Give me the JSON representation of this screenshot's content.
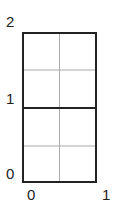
{
  "diagram": {
    "type": "grid-rectangle",
    "x_range": [
      0,
      1
    ],
    "y_range": [
      0,
      2
    ],
    "x_ticks": [
      "0",
      "1"
    ],
    "y_ticks": [
      "0",
      "1",
      "2"
    ],
    "thick_lines": [
      {
        "orientation": "horizontal",
        "at": 1
      }
    ],
    "thin_lines": [
      {
        "orientation": "vertical",
        "at": 0.5
      },
      {
        "orientation": "horizontal",
        "at": 0.5
      },
      {
        "orientation": "horizontal",
        "at": 1.5
      }
    ],
    "colors": {
      "border": "#222222",
      "grid": "#aaaaaa"
    }
  }
}
